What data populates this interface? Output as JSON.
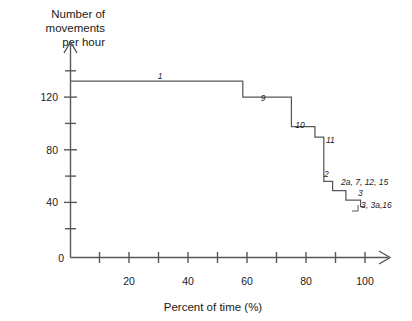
{
  "chart_data": {
    "type": "line",
    "title": "",
    "xlabel": "Percent of time (%)",
    "ylabel": "Number of movements per hour",
    "xlim": [
      0,
      105
    ],
    "ylim": [
      0,
      148
    ],
    "grid": false,
    "legend": "none",
    "x_ticks_major": [
      0,
      20,
      40,
      60,
      80,
      100
    ],
    "x_ticks_minor": [
      10,
      30,
      50,
      70,
      90
    ],
    "x_tick_labels": [
      "0",
      "20",
      "40",
      "60",
      "80",
      "100"
    ],
    "y_ticks_major": [
      0,
      40,
      80,
      120
    ],
    "y_ticks_minor": [
      20,
      60,
      100,
      140
    ],
    "y_tick_labels": [
      "0",
      "40",
      "80",
      "120"
    ],
    "curve_description": "Descending step function of movements per hour versus percent of time",
    "steps": [
      {
        "label": "1",
        "x_start": 0,
        "x_end": 58.5,
        "value": 132
      },
      {
        "label": "9",
        "x_start": 58.5,
        "x_end": 75.0,
        "value": 120
      },
      {
        "label": "10",
        "x_start": 75.0,
        "x_end": 83.0,
        "value": 98
      },
      {
        "label": "11",
        "x_start": 83.0,
        "x_end": 86.0,
        "value": 90
      },
      {
        "label": "2",
        "x_start": 86.0,
        "x_end": 89.0,
        "value": 57
      },
      {
        "label": "2a, 7, 12, 15",
        "x_start": 89.0,
        "x_end": 93.5,
        "value": 50
      },
      {
        "label": "3",
        "x_start": 93.5,
        "x_end": 98.5,
        "value": 43
      },
      {
        "label": "3, 3a, 16",
        "x_start": 98.5,
        "x_end": 100.0,
        "value": 38
      }
    ],
    "series_labels": [
      {
        "text": "1",
        "x": 160,
        "y": 79,
        "anchor": "middle"
      },
      {
        "text": "9",
        "x": 263,
        "y": 101,
        "anchor": "middle"
      },
      {
        "text": "10",
        "x": 300,
        "y": 128,
        "anchor": "middle"
      },
      {
        "text": "11",
        "x": 326,
        "y": 143,
        "anchor": "start"
      },
      {
        "text": "2",
        "x": 324,
        "y": 177,
        "anchor": "start"
      },
      {
        "text": "2a, 7, 12, 15",
        "x": 341,
        "y": 185,
        "anchor": "start"
      },
      {
        "text": "3",
        "x": 358,
        "y": 196,
        "anchor": "start"
      },
      {
        "text": "3, 3a,16",
        "x": 361,
        "y": 208,
        "anchor": "start"
      }
    ]
  },
  "axes": {
    "y_title_line1": "Number of",
    "y_title_line2": "movements",
    "y_title_line3": "per hour",
    "x_title": "Percent of time (%)"
  },
  "colors": {
    "line": "#58585a",
    "text": "#1a1a1a",
    "background": "#ffffff"
  }
}
